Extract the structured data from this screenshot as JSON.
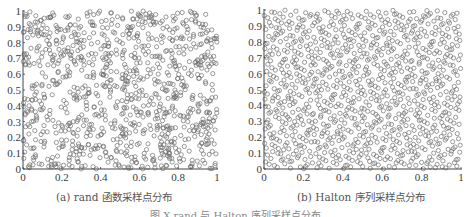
{
  "figure": {
    "caption_bottom": "图 X   rand 与 Halton 序列采样点分布"
  },
  "chart_data": [
    {
      "type": "scatter",
      "panel": "a",
      "title": "(a) rand 函数采样点分布",
      "xlabel": "",
      "ylabel": "",
      "xlim": [
        0,
        1
      ],
      "ylim": [
        0,
        1
      ],
      "xticks": [
        "0",
        "0.2",
        "0.4",
        "0.6",
        "0.8",
        "1"
      ],
      "yticks": [
        "0",
        "0.1",
        "0.2",
        "0.3",
        "0.4",
        "0.5",
        "0.6",
        "0.7",
        "0.8",
        "0.9",
        "1"
      ],
      "marker": "open-circle",
      "marker_color": "#707070",
      "n_points": 1000,
      "generator": "uniform random (clustered, uneven coverage)",
      "grid": false
    },
    {
      "type": "scatter",
      "panel": "b",
      "title": "(b) Halton 序列采样点分布",
      "xlabel": "",
      "ylabel": "",
      "xlim": [
        0,
        1
      ],
      "ylim": [
        0,
        1
      ],
      "xticks": [
        "0",
        "0.2",
        "0.4",
        "0.6",
        "0.8",
        "1"
      ],
      "yticks": [
        "0",
        "0.1",
        "0.2",
        "0.3",
        "0.4",
        "0.5",
        "0.6",
        "0.7",
        "0.8",
        "0.9",
        "1"
      ],
      "marker": "open-circle",
      "marker_color": "#707070",
      "n_points": 1000,
      "generator": "Halton sequence, bases 2 and 3 (even coverage)",
      "grid": false
    }
  ],
  "panels": {
    "a": {
      "caption": "(a) rand 函数采样点分布"
    },
    "b": {
      "caption": "(b) Halton 序列采样点分布"
    }
  }
}
